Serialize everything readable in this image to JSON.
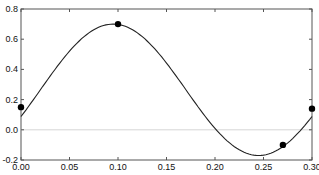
{
  "chart_data": {
    "type": "line",
    "title": "",
    "xlabel": "",
    "ylabel": "",
    "xlim": [
      0.0,
      0.3
    ],
    "ylim": [
      -0.2,
      0.8
    ],
    "grid": false,
    "zero_line": true,
    "x_ticks": [
      "0.00",
      "0.05",
      "0.10",
      "0.15",
      "0.20",
      "0.25",
      "0.30"
    ],
    "y_ticks": [
      "-0.2",
      "0.0",
      "0.2",
      "0.4",
      "0.6",
      "0.8"
    ],
    "series": [
      {
        "name": "curve",
        "style": "line",
        "x": [
          0.0,
          0.025,
          0.05,
          0.075,
          0.095,
          0.12,
          0.15,
          0.18,
          0.21,
          0.245,
          0.27,
          0.3
        ],
        "y": [
          0.15,
          0.36,
          0.55,
          0.67,
          0.7,
          0.65,
          0.46,
          0.2,
          -0.05,
          -0.17,
          -0.1,
          0.14
        ]
      },
      {
        "name": "points",
        "style": "markers",
        "x": [
          0.0,
          0.1,
          0.27,
          0.3
        ],
        "y": [
          0.15,
          0.7,
          -0.1,
          0.14
        ]
      }
    ]
  }
}
